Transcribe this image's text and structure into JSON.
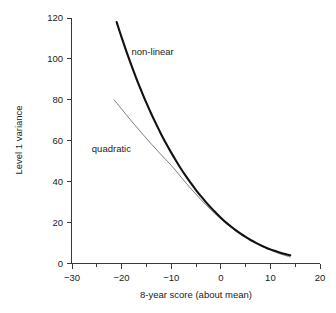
{
  "chart_data": {
    "type": "line",
    "title": "",
    "xlabel": "8-year score (about mean)",
    "ylabel": "Level 1 variance",
    "xlim": [
      -30,
      20
    ],
    "ylim": [
      0,
      120
    ],
    "xticks": [
      -30,
      -20,
      -10,
      0,
      10,
      20
    ],
    "xtick_labels": [
      "−30",
      "−20",
      "−10",
      "0",
      "10",
      "20"
    ],
    "xticks_minor": [
      -25,
      -15,
      -5,
      5,
      15
    ],
    "yticks": [
      0,
      20,
      40,
      60,
      80,
      100,
      120
    ],
    "ytick_labels": [
      "0",
      "20",
      "40",
      "60",
      "80",
      "100",
      "120"
    ],
    "grid": false,
    "legend_position": "inline-annotations",
    "series": [
      {
        "name": "non-linear",
        "label": "non-linear",
        "color": "#111111",
        "linewidth": 2.1,
        "x": [
          -21.0,
          -20.0,
          -19.0,
          -18.0,
          -17.0,
          -16.0,
          -15.0,
          -14.0,
          -13.0,
          -12.0,
          -11.0,
          -10.0,
          -9.0,
          -8.0,
          -7.0,
          -6.0,
          -5.0,
          -4.0,
          -3.0,
          -2.0,
          -1.0,
          0.0,
          1.0,
          2.0,
          3.0,
          4.0,
          5.0,
          6.0,
          7.0,
          8.0,
          9.0,
          10.0,
          11.0,
          12.0,
          13.0,
          14.0
        ],
        "y": [
          118.0,
          110.5,
          103.4,
          96.7,
          90.3,
          84.3,
          78.5,
          73.1,
          68.0,
          63.1,
          58.5,
          54.2,
          50.1,
          46.2,
          42.6,
          39.2,
          35.9,
          32.9,
          30.0,
          27.3,
          24.8,
          22.4,
          20.2,
          18.2,
          16.3,
          14.6,
          13.0,
          11.5,
          10.2,
          9.0,
          7.9,
          6.9,
          6.1,
          5.3,
          4.6,
          4.0
        ]
      },
      {
        "name": "quadratic",
        "label": "quadratic",
        "color": "#6e6e6e",
        "linewidth": 0.9,
        "x": [
          -21.5,
          -20.0,
          -18.0,
          -16.0,
          -14.0,
          -12.0,
          -10.0,
          -8.0,
          -6.0,
          -4.0,
          -2.0,
          0.0,
          2.0,
          4.0,
          6.0,
          8.0,
          10.0,
          12.0,
          14.0
        ],
        "y": [
          80.0,
          75.5,
          69.6,
          63.9,
          58.4,
          53.1,
          48.0,
          42.2,
          36.5,
          31.2,
          26.3,
          21.8,
          17.7,
          14.2,
          11.3,
          8.7,
          6.5,
          4.7,
          3.2
        ]
      }
    ],
    "annotations": [
      {
        "text": "non-linear",
        "x": -18.0,
        "y": 102.0,
        "name": "annotation-non-linear"
      },
      {
        "text": "quadratic",
        "x": -26.0,
        "y": 54.5,
        "name": "annotation-quadratic"
      }
    ]
  }
}
